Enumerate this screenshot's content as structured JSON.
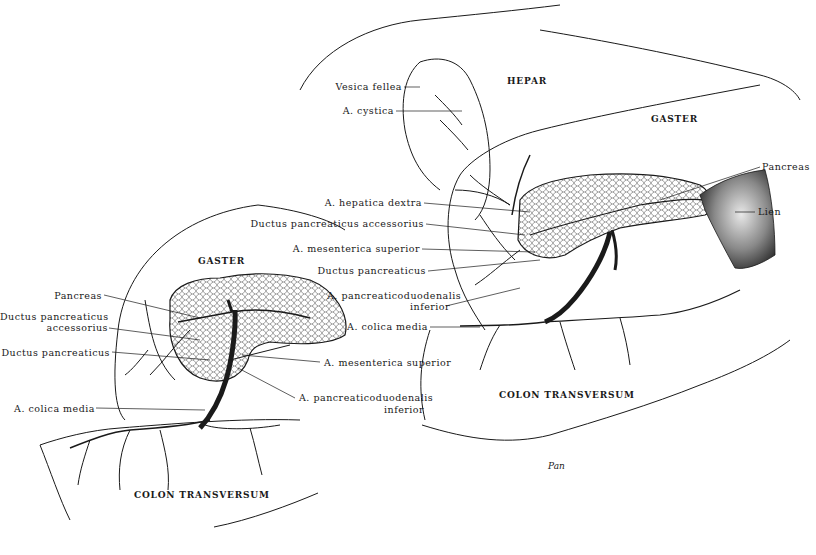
{
  "figure": {
    "left_panel": {
      "organs": {
        "gaster": "GASTER",
        "colon": "COLON TRANSVERSUM"
      },
      "labels": {
        "pancreas": "Pancreas",
        "ductus_accessorius_line1": "Ductus pancreaticus",
        "ductus_accessorius_line2": "accessorius",
        "ductus_pancreaticus": "Ductus pancreaticus",
        "colica_media": "A. colica media",
        "mesenterica_superior": "A. mesenterica superior",
        "pancreaticoduodenalis_line1": "A. pancreaticoduodenalis",
        "pancreaticoduodenalis_line2": "inferior"
      }
    },
    "right_panel": {
      "organs": {
        "hepar": "HEPAR",
        "gaster": "GASTER",
        "colon": "COLON TRANSVERSUM"
      },
      "labels": {
        "vesica_fellea": "Vesica fellea",
        "cystica": "A. cystica",
        "hepatica_dextra": "A. hepatica dextra",
        "ductus_accessorius": "Ductus pancreaticus accessorius",
        "mesenterica_superior": "A. mesenterica superior",
        "ductus_pancreaticus": "Ductus pancreaticus",
        "pancreaticoduodenalis_line1": "A. pancreaticoduodenalis",
        "pancreaticoduodenalis_line2": "inferior",
        "colica_media": "A. colica media",
        "pancreas": "Pancreas",
        "lien": "Lien"
      }
    },
    "credit": "Pan"
  }
}
